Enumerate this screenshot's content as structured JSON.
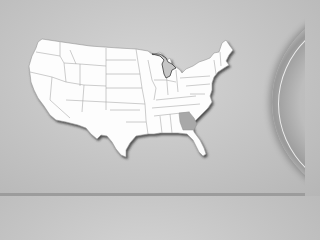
{
  "map": {
    "region": "United States",
    "highlighted_state": "Georgia",
    "colors": {
      "background": "#c8c8c8",
      "land": "#ffffff",
      "borders": "#9a9a9a",
      "highlight": "#a9a9a9",
      "shadow": "#3a3a3a"
    }
  }
}
